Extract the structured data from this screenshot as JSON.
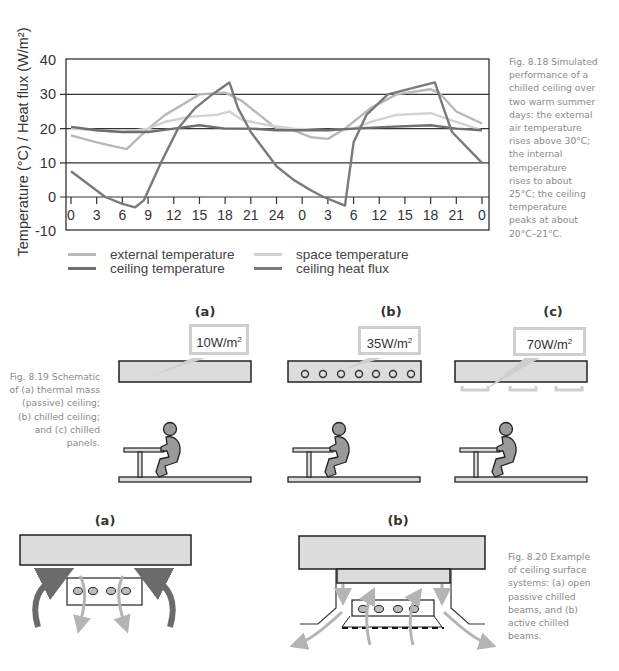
{
  "chart_data": {
    "type": "line",
    "title": "",
    "ylabel": "Temperature (°C) / Heat flux (W/m²)",
    "xlabel": "",
    "ylim": [
      -10,
      40
    ],
    "yticks": [
      40,
      30,
      20,
      10,
      0,
      -10
    ],
    "grid": "horizontal",
    "x_hours": [
      0,
      3,
      6,
      9,
      12,
      15,
      18,
      21,
      24,
      27,
      30,
      33,
      36,
      39,
      42,
      45,
      48
    ],
    "xtick_labels": [
      "0",
      "3",
      "6",
      "9",
      "12",
      "15",
      "18",
      "21",
      "24",
      "0",
      "3",
      "6",
      "12",
      "15",
      "18",
      "21",
      "0"
    ],
    "legend_position": "bottom",
    "series": [
      {
        "name": "external temperature",
        "color": "#b8b8b8",
        "points": [
          [
            0,
            18
          ],
          [
            3,
            16
          ],
          [
            6.5,
            14
          ],
          [
            9,
            20
          ],
          [
            11,
            24
          ],
          [
            13,
            27
          ],
          [
            15,
            30
          ],
          [
            18,
            30.5
          ],
          [
            20,
            28
          ],
          [
            22,
            24
          ],
          [
            24,
            20
          ],
          [
            26,
            19.5
          ],
          [
            28,
            17.5
          ],
          [
            30,
            17
          ],
          [
            32,
            20
          ],
          [
            35,
            26
          ],
          [
            38,
            30
          ],
          [
            42,
            31.5
          ],
          [
            43,
            30.5
          ],
          [
            45,
            25
          ],
          [
            48,
            21.5
          ]
        ]
      },
      {
        "name": "space temperature",
        "color": "#d2d2d2",
        "points": [
          [
            0,
            20
          ],
          [
            3,
            19.5
          ],
          [
            6,
            19
          ],
          [
            9,
            20
          ],
          [
            11,
            22
          ],
          [
            14,
            23.5
          ],
          [
            17,
            24
          ],
          [
            18.5,
            25
          ],
          [
            20,
            22.5
          ],
          [
            23,
            21
          ],
          [
            26,
            20
          ],
          [
            30,
            19.5
          ],
          [
            33,
            20
          ],
          [
            35,
            22
          ],
          [
            38,
            24
          ],
          [
            42,
            24.5
          ],
          [
            45,
            22
          ],
          [
            48,
            19.5
          ]
        ]
      },
      {
        "name": "ceiling temperature",
        "color": "#6e6e6e",
        "points": [
          [
            0,
            20.5
          ],
          [
            3,
            19.5
          ],
          [
            6,
            19
          ],
          [
            9,
            19
          ],
          [
            12,
            20
          ],
          [
            15,
            21
          ],
          [
            18,
            20
          ],
          [
            21,
            20
          ],
          [
            24,
            19.5
          ],
          [
            27,
            19.5
          ],
          [
            30,
            19.5
          ],
          [
            33,
            20
          ],
          [
            37,
            20.5
          ],
          [
            42,
            21
          ],
          [
            45,
            20
          ],
          [
            48,
            19.5
          ]
        ]
      },
      {
        "name": "ceiling heat flux",
        "color": "#7a7a7a",
        "points": [
          [
            0,
            7.5
          ],
          [
            4,
            0
          ],
          [
            6,
            -2
          ],
          [
            7.5,
            -3
          ],
          [
            8.5,
            -1
          ],
          [
            10.5,
            10
          ],
          [
            12.5,
            20
          ],
          [
            14.5,
            26
          ],
          [
            16.5,
            30
          ],
          [
            18.5,
            33.5
          ],
          [
            19.5,
            26
          ],
          [
            21,
            19
          ],
          [
            24,
            9
          ],
          [
            26,
            5
          ],
          [
            28,
            2
          ],
          [
            29.5,
            0
          ],
          [
            31.5,
            -2
          ],
          [
            32,
            -2.5
          ],
          [
            33,
            16
          ],
          [
            34.5,
            24
          ],
          [
            37,
            30
          ],
          [
            42.5,
            33.5
          ],
          [
            43.5,
            26
          ],
          [
            44.5,
            19
          ],
          [
            48,
            10
          ]
        ]
      }
    ]
  },
  "fig818": {
    "caption": "Fig. 8.18 Simulated\nperformance of a\nchilled ceiling over\ntwo warm summer\ndays: the external\nair temperature\nrises above 30°C;\nthe internal\ntemperature\nrises to about\n25°C; the ceiling\ntemperature\npeaks at about\n20°C–21°C."
  },
  "fig819": {
    "caption": "Fig. 8.19 Schematic\nof (a) thermal mass\n(passive) ceiling;\n(b) chilled ceiling;\nand (c) chilled\npanels.",
    "panels": [
      {
        "label": "(a)",
        "flux": "10W/m",
        "sup": "2"
      },
      {
        "label": "(b)",
        "flux": "35W/m",
        "sup": "2"
      },
      {
        "label": "(c)",
        "flux": "70W/m",
        "sup": "2"
      }
    ]
  },
  "fig820": {
    "caption": "Fig. 8.20 Example\nof ceiling surface\nsystems: (a) open\npassive chilled\nbeams, and (b)\nactive chilled\nbeams.",
    "panels": [
      {
        "label": "(a)"
      },
      {
        "label": "(b)"
      }
    ]
  },
  "colors": {
    "axis": "#333333",
    "grid": "#333333",
    "slab_fill": "#dcdcdc",
    "slab_stroke": "#222222",
    "figure_fill": "#9a9a9a",
    "arrow_dark": "#6b6b6b",
    "arrow_light": "#b4b4b4",
    "callout_border": "#cfcfcf"
  }
}
